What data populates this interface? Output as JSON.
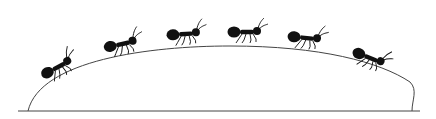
{
  "illustration": {
    "subject": "six ants walking in a line over a hill",
    "ant_count": 6,
    "colors": {
      "ink": "#111111",
      "background": "#ffffff",
      "line": "#333333"
    }
  }
}
